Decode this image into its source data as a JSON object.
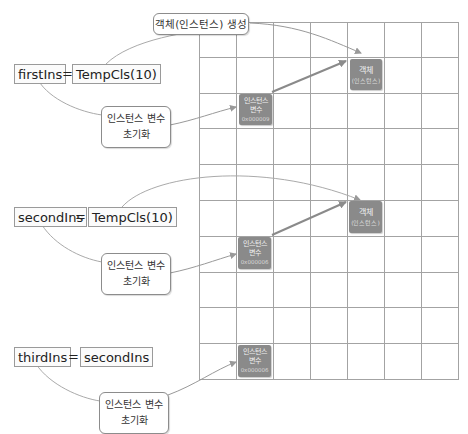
{
  "diagram": {
    "title_note": "객체(인스턴스) 생성",
    "memory_grid": {
      "columns": 7,
      "rows": 10,
      "line_color": "#a0a0a0"
    },
    "statements": [
      {
        "variable": "firstIns",
        "operator": "=",
        "expression": "TempCls(10)",
        "note": {
          "line1": "인스턴스 변수",
          "line2": "초기화"
        },
        "instance_var_box": {
          "line1": "인스턴스",
          "line2": "변수",
          "address": "0x000009"
        },
        "object_box": {
          "line1": "객체",
          "line2": "(인스턴스)"
        }
      },
      {
        "variable": "secondIns",
        "operator": "=",
        "expression": "TempCls(10)",
        "note": {
          "line1": "인스턴스 변수",
          "line2": "초기화"
        },
        "instance_var_box": {
          "line1": "인스턴스",
          "line2": "변수",
          "address": "0x000006"
        },
        "object_box": {
          "line1": "객체",
          "line2": "(인스턴스)"
        }
      },
      {
        "variable": "thirdIns",
        "operator": "=",
        "expression": "secondIns",
        "note": {
          "line1": "인스턴스 변수",
          "line2": "초기화"
        },
        "instance_var_box": {
          "line1": "인스턴스",
          "line2": "변수",
          "address": "0x000006"
        }
      }
    ],
    "colors": {
      "box_fill": "#8a8a8a",
      "arrow": "#888888",
      "thin_line": "#a8a8a8"
    }
  }
}
